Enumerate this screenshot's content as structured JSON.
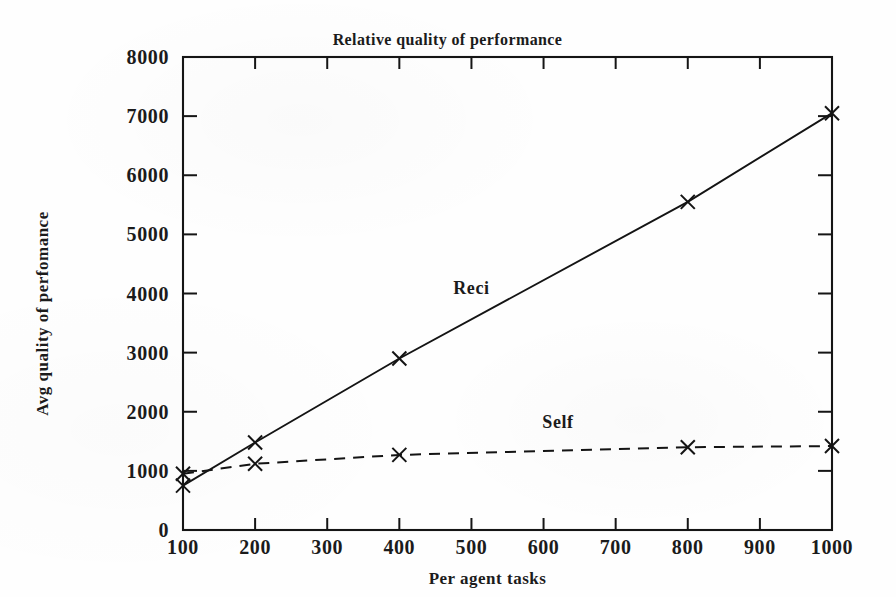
{
  "chart_data": {
    "type": "line",
    "title": "Relative quality of performance",
    "xlabel": "Per agent tasks",
    "ylabel": "Avg quality of perfomance",
    "xlim": [
      100,
      1000
    ],
    "ylim": [
      0,
      8000
    ],
    "xticks": [
      "100",
      "200",
      "300",
      "400",
      "500",
      "600",
      "700",
      "800",
      "900",
      "1000"
    ],
    "xtick_values": [
      100,
      200,
      300,
      400,
      500,
      600,
      700,
      800,
      900,
      1000
    ],
    "yticks": [
      "0",
      "1000",
      "2000",
      "3000",
      "4000",
      "5000",
      "6000",
      "7000",
      "8000"
    ],
    "ytick_values": [
      0,
      1000,
      2000,
      3000,
      4000,
      5000,
      6000,
      7000,
      8000
    ],
    "grid": false,
    "legend": "inline-annotations",
    "series": [
      {
        "name": "Reci",
        "style": "solid",
        "marker": "x",
        "label_x": 500,
        "label_y": 4000,
        "x": [
          100,
          200,
          400,
          800,
          1000
        ],
        "values": [
          750,
          1480,
          2900,
          5550,
          7050
        ]
      },
      {
        "name": "Self",
        "style": "dashed",
        "marker": "x",
        "label_x": 620,
        "label_y": 1720,
        "x": [
          100,
          200,
          400,
          800,
          1000
        ],
        "values": [
          950,
          1120,
          1270,
          1400,
          1420
        ]
      }
    ]
  }
}
